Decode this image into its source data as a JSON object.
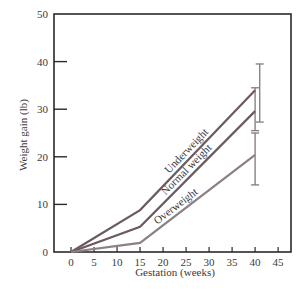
{
  "chart_data": {
    "type": "line",
    "title": "",
    "xlabel": "Gestation (weeks)",
    "ylabel": "Weight gain (lb)",
    "xlim": [
      -3.7,
      47.8
    ],
    "ylim": [
      0,
      50
    ],
    "xticks": [
      0,
      5,
      10,
      15,
      20,
      25,
      30,
      35,
      40,
      45
    ],
    "yticks": [
      0,
      10,
      20,
      30,
      40,
      50
    ],
    "grid": false,
    "legend": "inline-labels",
    "series": [
      {
        "name": "Underweight",
        "color": "#6b5a5e",
        "x": [
          0,
          15,
          40
        ],
        "y": [
          0,
          8.8,
          34
        ],
        "error_bar": {
          "x": 41,
          "low": 27.3,
          "high": 39.5
        }
      },
      {
        "name": "Normal weight",
        "color": "#6b5a5e",
        "x": [
          0,
          15,
          40
        ],
        "y": [
          0,
          5.3,
          29.6
        ],
        "error_bar": {
          "x": 40,
          "low": 25.5,
          "high": 34.5
        }
      },
      {
        "name": "Overweight",
        "color": "#8c8084",
        "x": [
          0,
          15,
          40
        ],
        "y": [
          0,
          1.9,
          20.4
        ],
        "error_bar": {
          "x": 40,
          "low": 14.1,
          "high": 25
        }
      }
    ]
  }
}
